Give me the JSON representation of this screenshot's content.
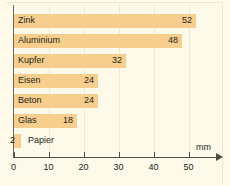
{
  "chart_data": {
    "type": "bar",
    "orientation": "horizontal",
    "title": "",
    "xlabel": "mm",
    "ylabel": "",
    "xlim": [
      0,
      55
    ],
    "grid": true,
    "legend": false,
    "unit": "mm",
    "categories": [
      "Zink",
      "Aluminium",
      "Kupfer",
      "Eisen",
      "Beton",
      "Glas",
      "Papier"
    ],
    "values": [
      52,
      48,
      32,
      24,
      24,
      18,
      2
    ],
    "xticks": [
      0,
      10,
      20,
      30,
      40,
      50
    ],
    "xtick_labels": [
      "0",
      "10",
      "20",
      "30",
      "40",
      "50"
    ],
    "bar_color": "#f7ce8e",
    "background_color": "#fdfaea",
    "axis_color": "#4d4d46",
    "grid_color": "#f0e9d2",
    "text_color": "#231f1a",
    "bars": [
      {
        "label": "Zink",
        "value": 52,
        "value_text": "52",
        "label_inside": true
      },
      {
        "label": "Aluminium",
        "value": 48,
        "value_text": "48",
        "label_inside": true
      },
      {
        "label": "Kupfer",
        "value": 32,
        "value_text": "32",
        "label_inside": true
      },
      {
        "label": "Eisen",
        "value": 24,
        "value_text": "24",
        "label_inside": true
      },
      {
        "label": "Beton",
        "value": 24,
        "value_text": "24",
        "label_inside": true
      },
      {
        "label": "Glas",
        "value": 18,
        "value_text": "18",
        "label_inside": true
      },
      {
        "label": "Papier",
        "value": 2,
        "value_text": "2",
        "label_inside": false
      }
    ]
  }
}
